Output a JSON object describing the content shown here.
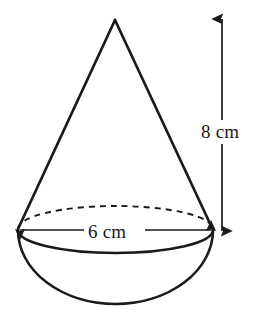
{
  "figure": {
    "background_color": "#ffffff",
    "stroke_color": "#1a1a1a",
    "labels": {
      "height": "8 cm",
      "diameter": "6 cm"
    },
    "shapes": {
      "cone": {
        "name": "cone",
        "apex": {
          "x": 115,
          "y": 20
        },
        "base_left": {
          "x": 18,
          "y": 230
        },
        "base_right": {
          "x": 213,
          "y": 230
        },
        "base_radius_x": 97.5,
        "base_radius_y": 23
      },
      "hemisphere": {
        "name": "hemisphere",
        "center": {
          "x": 115.5,
          "y": 230
        },
        "radius_x": 97.5,
        "radius_y": 74,
        "bottom": {
          "x": 115.5,
          "y": 304
        }
      },
      "base_ellipse": {
        "name": "base-ellipse",
        "center": {
          "x": 115.5,
          "y": 230
        },
        "radius_x": 97.5,
        "radius_y": 23,
        "back_arc_style": "dashed",
        "front_arc_style": "solid"
      }
    },
    "dimensions": {
      "height_arrow": {
        "name": "height-dimension-arrow",
        "orientation": "vertical",
        "x": 222,
        "y_top": 18,
        "y_bottom": 232,
        "value": "8 cm",
        "arrowheads": "both"
      },
      "diameter_arrow": {
        "name": "diameter-dimension-arrow",
        "orientation": "horizontal",
        "y": 230,
        "x_left": 19,
        "x_right": 212,
        "value": "6 cm",
        "arrowheads": "both"
      }
    }
  }
}
